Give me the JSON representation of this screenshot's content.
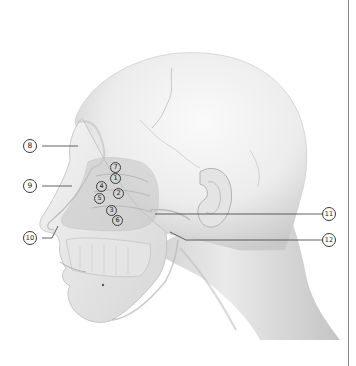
{
  "figure": {
    "colors": {
      "background": "#ffffff",
      "skin_light": "#f2f2f2",
      "skin_mid": "#dcdcdc",
      "skin_shadow": "#b8b8b8",
      "cavity_overlay": "#c9c9c9",
      "leader_line": "#3a3a3a",
      "border_rule": "#8a8a8a"
    },
    "labels": [
      {
        "num": "1",
        "glyph": "①",
        "x": 113,
        "y": 178
      },
      {
        "num": "2",
        "glyph": "②",
        "x": 117,
        "y": 193
      },
      {
        "num": "3",
        "glyph": "③",
        "x": 110,
        "y": 209
      },
      {
        "num": "4",
        "glyph": "④",
        "x": 100,
        "y": 185
      },
      {
        "num": "5",
        "glyph": "⑤",
        "x": 98,
        "y": 197
      },
      {
        "num": "6",
        "glyph": "⑥",
        "x": 116,
        "y": 220
      },
      {
        "num": "7",
        "glyph": "⑦",
        "x": 113,
        "y": 167
      },
      {
        "num": "8",
        "glyph": "⑧",
        "x": 29,
        "y": 146
      },
      {
        "num": "9",
        "glyph": "⑨",
        "x": 29,
        "y": 186
      },
      {
        "num": "10",
        "glyph": "⑩",
        "x": 29,
        "y": 238
      },
      {
        "num": "11",
        "glyph": "⑪",
        "x": 324,
        "y": 214
      },
      {
        "num": "12",
        "glyph": "⑫",
        "x": 324,
        "y": 240
      }
    ]
  }
}
